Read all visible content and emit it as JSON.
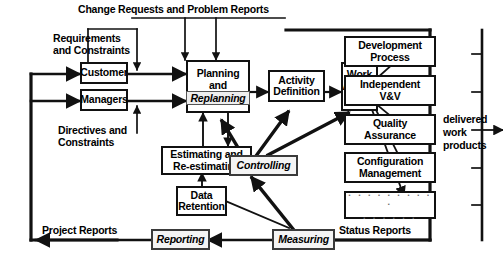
{
  "diagram": {
    "type": "flow-diagram",
    "colors": {
      "stroke": "#111111",
      "background": "#ffffff",
      "italic_box_fill": "#f4f4f4",
      "italic_box_stroke": "#3a3a3a",
      "dots": "#6c6c6c"
    },
    "nodes": [
      {
        "id": "customer",
        "label": "Customer",
        "style": "plain"
      },
      {
        "id": "managers",
        "label": "Managers",
        "style": "plain"
      },
      {
        "id": "planning",
        "label_line1": "Planning",
        "label_line2": "and",
        "label_line3": "Replanning",
        "style": "mixed"
      },
      {
        "id": "activity-definition",
        "label": "Activity\nDefinition",
        "style": "plain"
      },
      {
        "id": "work-assignments",
        "label": "Work\nAssign\nments",
        "style": "plain"
      },
      {
        "id": "estimating",
        "label": "Estimating and\nRe-estimating",
        "style": "plain"
      },
      {
        "id": "data-retention",
        "label": "Data\nRetention",
        "style": "plain"
      },
      {
        "id": "controlling",
        "label": "Controlling",
        "style": "italic"
      },
      {
        "id": "development-process",
        "label": "Development\nProcess",
        "style": "plain"
      },
      {
        "id": "independent-vv",
        "label": "Independent\nV&V",
        "style": "plain"
      },
      {
        "id": "quality-assurance",
        "label": "Quality\nAssurance",
        "style": "plain"
      },
      {
        "id": "configuration-management",
        "label": "Configuration\nManagement",
        "style": "plain"
      },
      {
        "id": "other-processes",
        "label": "",
        "dots_line1": ". . . . . . . . . .",
        "dots_line2": ". . . . . .",
        "style": "dots"
      },
      {
        "id": "reporting",
        "label": "Reporting",
        "style": "italic"
      },
      {
        "id": "measuring",
        "label": "Measuring",
        "style": "italic"
      }
    ],
    "edge_labels": [
      {
        "id": "change-requests",
        "text": "Change Requests and Problem Reports"
      },
      {
        "id": "requirements",
        "text": "Requirements\nand Constraints"
      },
      {
        "id": "directives",
        "text": "Directives and\nConstraints"
      },
      {
        "id": "delivered-work-products",
        "text": "delivered\nwork\nproducts"
      },
      {
        "id": "status-reports",
        "text": "Status Reports"
      },
      {
        "id": "project-reports",
        "text": "Project Reports"
      }
    ]
  }
}
